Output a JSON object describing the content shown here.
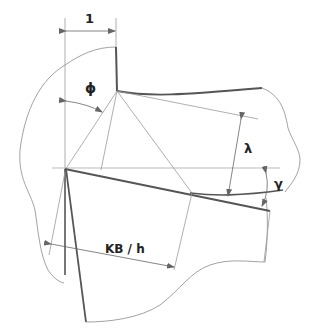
{
  "diagram": {
    "type": "cutting-tool-geometry",
    "labels": {
      "dim_1": "1",
      "phi": "ϕ",
      "lambda": "λ",
      "gamma": "γ",
      "kb_h": "KB / h"
    },
    "colors": {
      "thin_line": "#9a9a9a",
      "thick_line": "#555555",
      "outline": "#8a8a8a",
      "arrow": "#666666",
      "text": "#222222"
    }
  }
}
